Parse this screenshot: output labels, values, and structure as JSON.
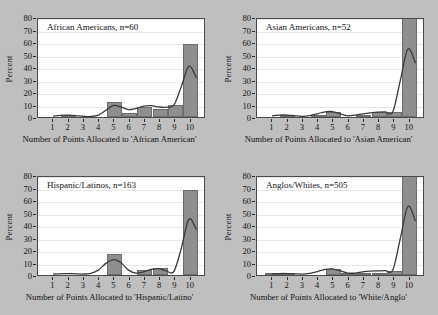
{
  "figure": {
    "background_color": "#bfbfbf",
    "panel_background": "#ffffff",
    "bar_color": "#8e8e8e",
    "bar_edge_color": "#6d6d6d",
    "curve_color": "#3a3a3a"
  },
  "chart_data": [
    {
      "type": "bar",
      "title": "African Americans, n=60",
      "xlabel": "Number of Points Allocated to 'African American'",
      "ylabel": "Percent",
      "categories": [
        "1",
        "2",
        "3",
        "4",
        "5",
        "6",
        "7",
        "8",
        "9",
        "10"
      ],
      "values": [
        0,
        1.7,
        0,
        0,
        11.7,
        3.3,
        8.3,
        6.7,
        10.0,
        58.3
      ],
      "ylim": [
        0,
        80
      ],
      "yticks": [
        0,
        10,
        20,
        30,
        40,
        50,
        60,
        70,
        80
      ],
      "grid": true,
      "legend": "none",
      "overlay_curve": {
        "name": "kernel density fit",
        "x": [
          1,
          1.5,
          2,
          2.5,
          3,
          3.5,
          4,
          4.5,
          5,
          5.5,
          6,
          6.5,
          7,
          7.5,
          8,
          8.5,
          9,
          9.5,
          10,
          10.5
        ],
        "y": [
          0.8,
          1.4,
          1.5,
          1.2,
          0.6,
          0.4,
          1.5,
          5.5,
          9.5,
          8.2,
          6.0,
          7.0,
          8.8,
          9.2,
          8.2,
          8.0,
          9.6,
          25.0,
          41.5,
          32.0
        ]
      }
    },
    {
      "type": "bar",
      "title": "Asian Americans, n=52",
      "xlabel": "Number of Points Allocated to 'Asian American'",
      "ylabel": "Percent",
      "categories": [
        "1",
        "2",
        "3",
        "4",
        "5",
        "6",
        "7",
        "8",
        "9",
        "10"
      ],
      "values": [
        0,
        1.9,
        0,
        1.9,
        3.8,
        0,
        1.9,
        3.8,
        3.8,
        82.7
      ],
      "ylim": [
        0,
        80
      ],
      "yticks": [
        0,
        10,
        20,
        30,
        40,
        50,
        60,
        70,
        80
      ],
      "grid": true,
      "legend": "none",
      "overlay_curve": {
        "name": "kernel density fit",
        "x": [
          1,
          1.5,
          2,
          2.5,
          3,
          3.5,
          4,
          4.5,
          5,
          5.5,
          6,
          6.5,
          7,
          7.5,
          8,
          8.5,
          9,
          9.5,
          10,
          10.5
        ],
        "y": [
          1.0,
          1.6,
          1.6,
          1.0,
          0.6,
          1.2,
          2.6,
          4.2,
          4.4,
          2.6,
          1.0,
          1.6,
          2.6,
          3.4,
          4.0,
          4.2,
          4.2,
          30.0,
          55.5,
          44.0
        ]
      }
    },
    {
      "type": "bar",
      "title": "Hispanic/Latinos, n=163",
      "xlabel": "Number of Points Allocated to 'Hispanic/Latino'",
      "ylabel": "Percent",
      "categories": [
        "1",
        "2",
        "3",
        "4",
        "5",
        "6",
        "7",
        "8",
        "9",
        "10"
      ],
      "values": [
        0,
        0,
        0,
        0,
        17.2,
        0,
        4.3,
        5.5,
        0,
        68.1
      ],
      "ylim": [
        0,
        80
      ],
      "yticks": [
        0,
        10,
        20,
        30,
        40,
        50,
        60,
        70,
        80
      ],
      "grid": true,
      "legend": "none",
      "overlay_curve": {
        "name": "kernel density fit",
        "x": [
          1,
          1.5,
          2,
          2.5,
          3,
          3.5,
          4,
          4.5,
          5,
          5.5,
          6,
          6.5,
          7,
          7.5,
          8,
          8.5,
          9,
          9.5,
          10,
          10.5
        ],
        "y": [
          0.8,
          1.0,
          1.2,
          1.0,
          0.8,
          1.4,
          4.0,
          9.5,
          12.6,
          10.0,
          4.0,
          1.6,
          2.6,
          4.6,
          5.2,
          3.4,
          2.8,
          22.0,
          45.5,
          37.0
        ]
      }
    },
    {
      "type": "bar",
      "title": "Anglos/Whites, n=505",
      "xlabel": "Number of Points Allocated to 'White/Anglo'",
      "ylabel": "Percent",
      "categories": [
        "1",
        "2",
        "3",
        "4",
        "5",
        "6",
        "7",
        "8",
        "9",
        "10"
      ],
      "values": [
        0.8,
        0.8,
        0,
        0,
        5.0,
        0.6,
        1.2,
        2.0,
        3.4,
        82.6
      ],
      "ylim": [
        0,
        80
      ],
      "yticks": [
        0,
        10,
        20,
        30,
        40,
        50,
        60,
        70,
        80
      ],
      "grid": true,
      "legend": "none",
      "overlay_curve": {
        "name": "kernel density fit",
        "x": [
          1,
          1.5,
          2,
          2.5,
          3,
          3.5,
          4,
          4.5,
          5,
          5.5,
          6,
          6.5,
          7,
          7.5,
          8,
          8.5,
          9,
          9.5,
          10,
          10.5
        ],
        "y": [
          1.0,
          1.2,
          1.2,
          1.0,
          0.8,
          1.4,
          2.8,
          4.6,
          5.0,
          3.4,
          1.6,
          1.6,
          2.6,
          3.2,
          3.4,
          3.6,
          4.0,
          30.0,
          56.0,
          44.0
        ]
      }
    }
  ]
}
